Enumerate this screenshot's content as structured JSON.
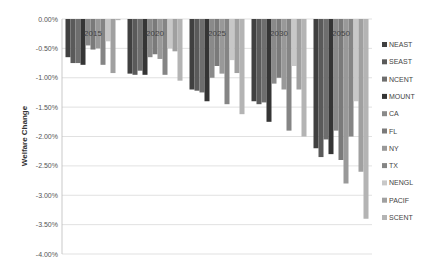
{
  "chart_data": {
    "type": "bar",
    "title": "",
    "xlabel": "",
    "ylabel": "Welfare Change",
    "ylim": [
      -4.0,
      0.0
    ],
    "yticks": [
      "0.00%",
      "-0.50%",
      "-1.00%",
      "-1.50%",
      "-2.00%",
      "-2.50%",
      "-3.00%",
      "-3.50%",
      "-4.00%"
    ],
    "grid": true,
    "legend_position": "right",
    "categories": [
      "2015",
      "2020",
      "2025",
      "2030",
      "2050"
    ],
    "series": [
      {
        "name": "NEAST",
        "color": "#404040",
        "values": [
          -0.65,
          -0.93,
          -1.2,
          -1.4,
          -2.2
        ]
      },
      {
        "name": "SEAST",
        "color": "#5a5a5a",
        "values": [
          -0.75,
          -0.95,
          -1.22,
          -1.45,
          -2.35
        ]
      },
      {
        "name": "NCENT",
        "color": "#6e6e6e",
        "values": [
          -0.75,
          -0.88,
          -1.25,
          -1.42,
          -2.05
        ]
      },
      {
        "name": "MOUNT",
        "color": "#353535",
        "values": [
          -0.78,
          -0.95,
          -1.4,
          -1.75,
          -2.3
        ]
      },
      {
        "name": "CA",
        "color": "#8a8a8a",
        "values": [
          -0.45,
          -0.65,
          -1.0,
          -1.1,
          -1.9
        ]
      },
      {
        "name": "FL",
        "color": "#7a7a7a",
        "values": [
          -0.52,
          -0.6,
          -0.8,
          -1.0,
          -2.4
        ]
      },
      {
        "name": "NY",
        "color": "#999999",
        "values": [
          -0.5,
          -0.68,
          -0.93,
          -1.2,
          -2.8
        ]
      },
      {
        "name": "TX",
        "color": "#858585",
        "values": [
          -0.78,
          -0.95,
          -1.45,
          -1.9,
          -2.0
        ]
      },
      {
        "name": "NENGL",
        "color": "#c8c8c8",
        "values": [
          -0.38,
          -0.5,
          -0.7,
          -0.8,
          -1.4
        ]
      },
      {
        "name": "PACIF",
        "color": "#a0a0a0",
        "values": [
          -0.92,
          -0.55,
          -0.92,
          -1.2,
          -2.6
        ]
      },
      {
        "name": "SCENT",
        "color": "#b4b4b4",
        "values": [
          -0.02,
          -1.05,
          -1.62,
          -2.0,
          -3.4
        ]
      }
    ]
  }
}
